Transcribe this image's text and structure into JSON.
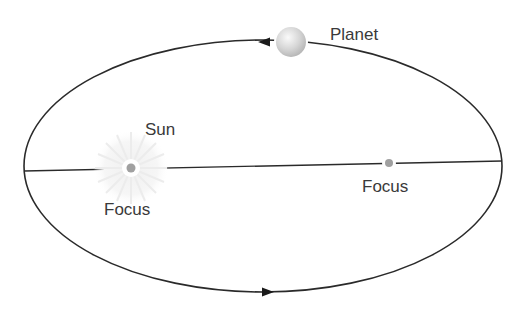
{
  "diagram": {
    "labels": {
      "planet": "Planet",
      "sun": "Sun",
      "focus_left": "Focus",
      "focus_right": "Focus"
    },
    "colors": {
      "orbit": "#2a2a2a",
      "axis": "#2a2a2a",
      "focus_dot": "#a0a0a0",
      "planet_fill": "#d8d8d8",
      "sun_glow": "#eeeeee",
      "text": "#3a3a3a"
    },
    "geometry": {
      "ellipse": {
        "cx": 263,
        "cy": 166,
        "rx": 239,
        "ry": 126
      },
      "major_axis": {
        "x1": 24,
        "y1": 171,
        "x2": 502,
        "y2": 161
      },
      "sun_focus": {
        "x": 131,
        "y": 168
      },
      "empty_focus": {
        "x": 389,
        "y": 163
      },
      "planet": {
        "x": 291,
        "y": 42,
        "r": 15
      }
    },
    "direction_arrows": [
      "top-arrow-pointing-left",
      "bottom-arrow-pointing-right"
    ]
  }
}
